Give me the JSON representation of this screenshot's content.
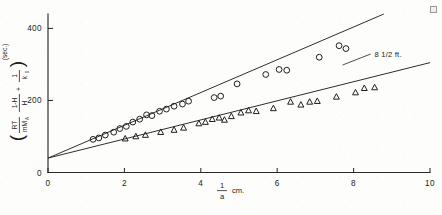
{
  "chart_data": {
    "type": "scatter",
    "title": "",
    "subtitle": "",
    "xlabel_numerator": "1",
    "xlabel_denominator": "a",
    "xlabel_unit": "cm.",
    "ylabel_unit": "(sec.)",
    "ylabel_terms": {
      "term1_numerator": "RT",
      "term1_denominator": "mM",
      "term1_denominator_sub": "A",
      "term2_numerator": "1-H",
      "term2_denominator": "H",
      "term3_numerator": "1",
      "term3_denominator": "k",
      "term3_denominator_sub": "0",
      "plus": "+"
    },
    "xlim": [
      0,
      10
    ],
    "ylim": [
      0,
      440
    ],
    "xticks": [
      0,
      2,
      4,
      6,
      8,
      10
    ],
    "xticklabels": [
      "0",
      "2",
      "4",
      "6",
      "8",
      "10"
    ],
    "yticks": [
      0,
      200,
      400
    ],
    "yticklabels": [
      "0",
      "200",
      "400"
    ],
    "grid": false,
    "legend_position": "none",
    "annotations": [
      {
        "text": "8 1/2 ft.",
        "x": 8.55,
        "y": 322
      }
    ],
    "series": [
      {
        "name": "upper-series",
        "marker": "circle",
        "color": "#1f1f1f",
        "fit_intercept": 40,
        "fit_slope": 45.5,
        "fit_x_range": [
          0,
          10
        ],
        "points": [
          {
            "x": 1.18,
            "y": 92
          },
          {
            "x": 1.33,
            "y": 96
          },
          {
            "x": 1.5,
            "y": 104
          },
          {
            "x": 1.72,
            "y": 112
          },
          {
            "x": 1.88,
            "y": 122
          },
          {
            "x": 2.05,
            "y": 128
          },
          {
            "x": 2.22,
            "y": 140
          },
          {
            "x": 2.4,
            "y": 148
          },
          {
            "x": 2.58,
            "y": 160
          },
          {
            "x": 2.72,
            "y": 158
          },
          {
            "x": 2.92,
            "y": 170
          },
          {
            "x": 3.1,
            "y": 176
          },
          {
            "x": 3.3,
            "y": 184
          },
          {
            "x": 3.52,
            "y": 190
          },
          {
            "x": 3.68,
            "y": 198
          },
          {
            "x": 4.35,
            "y": 208
          },
          {
            "x": 4.52,
            "y": 212
          },
          {
            "x": 4.95,
            "y": 246
          },
          {
            "x": 5.7,
            "y": 272
          },
          {
            "x": 6.05,
            "y": 286
          },
          {
            "x": 6.25,
            "y": 284
          },
          {
            "x": 7.1,
            "y": 320
          },
          {
            "x": 7.62,
            "y": 352
          },
          {
            "x": 7.8,
            "y": 344
          }
        ]
      },
      {
        "name": "lower-series",
        "marker": "triangle",
        "color": "#1f1f1f",
        "fit_intercept": 40,
        "fit_slope": 26.5,
        "fit_x_range": [
          0,
          10
        ],
        "points": [
          {
            "x": 2.02,
            "y": 94
          },
          {
            "x": 2.3,
            "y": 100
          },
          {
            "x": 2.55,
            "y": 104
          },
          {
            "x": 2.95,
            "y": 112
          },
          {
            "x": 3.3,
            "y": 118
          },
          {
            "x": 3.55,
            "y": 124
          },
          {
            "x": 3.95,
            "y": 136
          },
          {
            "x": 4.12,
            "y": 140
          },
          {
            "x": 4.3,
            "y": 148
          },
          {
            "x": 4.48,
            "y": 152
          },
          {
            "x": 4.62,
            "y": 146
          },
          {
            "x": 4.8,
            "y": 156
          },
          {
            "x": 5.05,
            "y": 166
          },
          {
            "x": 5.25,
            "y": 172
          },
          {
            "x": 5.45,
            "y": 170
          },
          {
            "x": 5.9,
            "y": 178
          },
          {
            "x": 6.35,
            "y": 196
          },
          {
            "x": 6.62,
            "y": 188
          },
          {
            "x": 6.85,
            "y": 196
          },
          {
            "x": 7.05,
            "y": 198
          },
          {
            "x": 7.55,
            "y": 210
          },
          {
            "x": 8.05,
            "y": 222
          },
          {
            "x": 8.28,
            "y": 234
          },
          {
            "x": 8.55,
            "y": 236
          }
        ]
      }
    ]
  }
}
